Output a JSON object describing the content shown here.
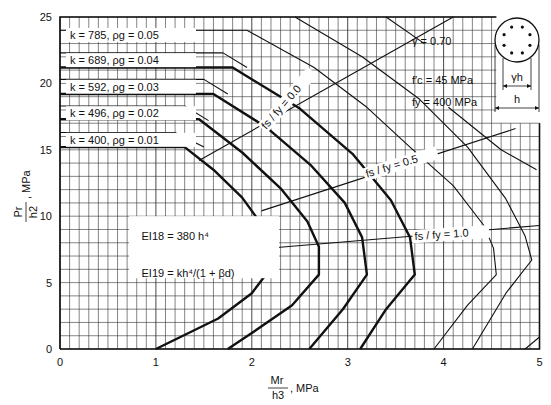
{
  "chart_data": {
    "type": "line",
    "title": "",
    "xlabel": "Mr / h^3, MPa",
    "ylabel": "Pr / h^2, MPa",
    "xlim": [
      0,
      5
    ],
    "ylim": [
      0,
      25
    ],
    "x_ticks": [
      "0",
      "1",
      "2",
      "3",
      "4",
      "5"
    ],
    "y_ticks": [
      "0",
      "5",
      "10",
      "15",
      "20",
      "25"
    ],
    "grid": {
      "x_step": 0.1,
      "y_step": 1
    },
    "parameters": {
      "gamma": "γ  = 0.70",
      "fc": "f′c =  45  MPa",
      "fy": "fy = 400  MPa"
    },
    "stiffness_notes": {
      "ei18": "EI18 = 380 h⁴",
      "ei19": "EI19 = kh⁴/(1 + βd)"
    },
    "section_diagram": {
      "inner_label": "γh",
      "outer_label": "h",
      "bars": 8
    },
    "series_labels": [
      {
        "text": "k =  785,  ρg = 0.05",
        "rho": 0.05,
        "k": 785
      },
      {
        "text": "k =  689,  ρg = 0.04",
        "rho": 0.04,
        "k": 689
      },
      {
        "text": "k =  592,  ρg = 0.03",
        "rho": 0.03,
        "k": 592
      },
      {
        "text": "k =  496,  ρg = 0.02",
        "rho": 0.02,
        "k": 496
      },
      {
        "text": "k =  400,  ρg = 0.01",
        "rho": 0.01,
        "k": 400
      }
    ],
    "series": [
      {
        "name": "EI19 rho_g=0.01 (k=400)",
        "style": "thick",
        "points": [
          [
            0,
            15.2
          ],
          [
            1.3,
            15.2
          ],
          [
            1.6,
            13.5
          ],
          [
            1.9,
            11.4
          ],
          [
            2.1,
            9.4
          ],
          [
            2.22,
            7.6
          ],
          [
            2.19,
            6.0
          ],
          [
            2.0,
            4.2
          ],
          [
            1.65,
            2.3
          ],
          [
            1.0,
            0
          ]
        ]
      },
      {
        "name": "EI19 rho_g=0.02 (k=496)",
        "style": "thick",
        "points": [
          [
            0,
            17.3
          ],
          [
            1.45,
            17.3
          ],
          [
            1.9,
            14.8
          ],
          [
            2.3,
            12.1
          ],
          [
            2.58,
            9.6
          ],
          [
            2.7,
            7.7
          ],
          [
            2.7,
            5.6
          ],
          [
            2.42,
            3.3
          ],
          [
            2.0,
            1.2
          ],
          [
            1.75,
            0
          ]
        ]
      },
      {
        "name": "EI19 rho_g=0.03 (k=592)",
        "style": "thick",
        "points": [
          [
            0,
            19.2
          ],
          [
            1.6,
            19.2
          ],
          [
            2.15,
            16.7
          ],
          [
            2.62,
            13.8
          ],
          [
            2.97,
            11.0
          ],
          [
            3.15,
            8.4
          ],
          [
            3.2,
            5.6
          ],
          [
            2.95,
            3.0
          ],
          [
            2.6,
            0
          ]
        ]
      },
      {
        "name": "EI19 rho_g=0.04 (k=689)",
        "style": "thick",
        "points": [
          [
            0,
            21.2
          ],
          [
            1.8,
            21.2
          ],
          [
            2.5,
            18.1
          ],
          [
            3.05,
            14.7
          ],
          [
            3.45,
            11.2
          ],
          [
            3.65,
            8.4
          ],
          [
            3.7,
            5.6
          ],
          [
            3.4,
            3.0
          ],
          [
            3.13,
            0
          ]
        ]
      },
      {
        "name": "EI18 rho_g=0.01",
        "style": "thin",
        "points": [
          [
            0,
            16.3
          ],
          [
            1.2,
            16.3
          ],
          [
            1.5,
            15.2
          ]
        ]
      },
      {
        "name": "EI18 rho_g=0.02",
        "style": "thin",
        "points": [
          [
            0,
            18.3
          ],
          [
            1.3,
            18.3
          ],
          [
            1.55,
            17.2
          ]
        ]
      },
      {
        "name": "EI18 rho_g=0.03",
        "style": "thin",
        "points": [
          [
            0,
            20.3
          ],
          [
            1.5,
            20.3
          ],
          [
            1.75,
            19.2
          ]
        ]
      },
      {
        "name": "EI18 rho_g=0.04",
        "style": "thin",
        "points": [
          [
            0,
            22.3
          ],
          [
            1.7,
            22.3
          ],
          [
            1.95,
            21.2
          ]
        ]
      },
      {
        "name": "rho_g=0.05 upper",
        "style": "thin",
        "points": [
          [
            0,
            24.0
          ],
          [
            1.95,
            24.0
          ],
          [
            2.65,
            21.2
          ],
          [
            3.2,
            18.2
          ],
          [
            3.65,
            15.2
          ],
          [
            4.1,
            12.3
          ],
          [
            4.42,
            9.3
          ],
          [
            4.52,
            7.6
          ],
          [
            4.55,
            5.6
          ],
          [
            4.25,
            3.3
          ],
          [
            3.9,
            0
          ]
        ]
      },
      {
        "name": "rho_g=0.05 lower",
        "style": "thin",
        "points": [
          [
            2.45,
            25
          ],
          [
            3.15,
            22.0
          ],
          [
            3.75,
            18.8
          ],
          [
            4.25,
            15.2
          ],
          [
            4.65,
            11.3
          ],
          [
            4.85,
            8.5
          ],
          [
            4.92,
            6.7
          ],
          [
            4.65,
            4.2
          ],
          [
            4.3,
            0
          ]
        ]
      },
      {
        "name": "outer extension",
        "style": "thin",
        "points": [
          [
            3.4,
            25
          ],
          [
            3.8,
            23.0
          ]
        ]
      },
      {
        "name": "outer extension 2",
        "style": "thin",
        "points": [
          [
            4.05,
            18.2
          ],
          [
            4.6,
            15.0
          ],
          [
            4.97,
            13.5
          ]
        ]
      },
      {
        "name": "outer extension 3",
        "style": "thin",
        "points": [
          [
            4.85,
            0
          ],
          [
            5.0,
            0.9
          ]
        ]
      }
    ],
    "ratio_lines": [
      {
        "label": "fs / fy = 0.0",
        "points": [
          [
            1.45,
            14.2
          ],
          [
            4.1,
            25
          ]
        ]
      },
      {
        "label": "fs / fy = 0.5",
        "points": [
          [
            2.1,
            10.4
          ],
          [
            4.75,
            16.6
          ]
        ]
      },
      {
        "label": "fs / fy = 1.0",
        "points": [
          [
            2.2,
            7.6
          ],
          [
            5.0,
            9.3
          ]
        ]
      }
    ]
  },
  "axes": {
    "x_label_num": "M",
    "x_label_num_sub": "r",
    "x_label_den": "h",
    "x_label_den_sup": "3",
    "x_label_units": ", MPa",
    "y_label_num": "P",
    "y_label_num_sub": "r",
    "y_label_den": "h",
    "y_label_den_sup": "2",
    "y_label_units": ", MPa"
  }
}
